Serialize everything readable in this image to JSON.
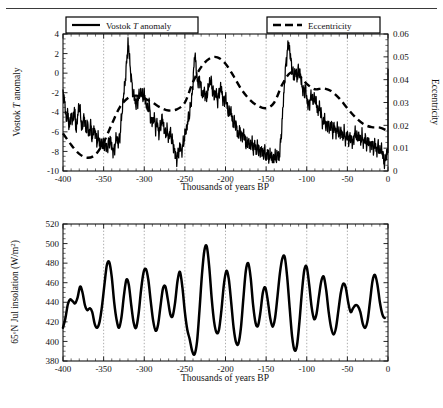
{
  "figure": {
    "divider": "horizontal-rule"
  },
  "chart_data": [
    {
      "type": "line",
      "id": "vostok-eccentricity",
      "title": "",
      "xlabel": "Thousands of years BP",
      "ylabel": "Vostok T anomaly",
      "ylabel2": "Eccentricity",
      "xlim": [
        -400,
        0
      ],
      "ylim": [
        -10,
        4
      ],
      "ylim2": [
        0,
        0.06
      ],
      "xticks": [
        -400,
        -350,
        -300,
        -250,
        -200,
        -150,
        -100,
        -50,
        0
      ],
      "xticklabels": [
        "-400",
        "-350",
        "-300",
        "-250",
        "-200",
        "-150",
        "-100",
        "-50",
        "0"
      ],
      "yticks": [
        -10,
        -8,
        -6,
        -4,
        -2,
        0,
        2,
        4
      ],
      "yticklabels": [
        "-10",
        "-8",
        "-6",
        "-4",
        "-2",
        "0",
        "2",
        "4"
      ],
      "y2ticks": [
        0,
        0.01,
        0.02,
        0.03,
        0.04,
        0.05,
        0.06
      ],
      "y2ticklabels": [
        "0",
        "0.01",
        "0.02",
        "0.03",
        "0.04",
        "0.05",
        "0.06"
      ],
      "grid": "vertical-dotted",
      "legend_position": "top",
      "legend": [
        {
          "label": "Vostok T anomaly",
          "style": "solid"
        },
        {
          "label": "Eccentricity",
          "style": "dashed"
        }
      ],
      "series": [
        {
          "name": "Vostok T anomaly",
          "style": "solid",
          "axis": "left",
          "x": [
            -400,
            -398,
            -396,
            -394,
            -392,
            -390,
            -388,
            -386,
            -384,
            -382,
            -380,
            -378,
            -376,
            -374,
            -372,
            -370,
            -368,
            -366,
            -364,
            -362,
            -360,
            -358,
            -356,
            -354,
            -352,
            -350,
            -348,
            -346,
            -344,
            -342,
            -340,
            -338,
            -336,
            -334,
            -332,
            -330,
            -328,
            -326,
            -324,
            -322,
            -320,
            -318,
            -316,
            -314,
            -312,
            -310,
            -308,
            -306,
            -304,
            -302,
            -300,
            -298,
            -296,
            -294,
            -292,
            -290,
            -288,
            -286,
            -284,
            -282,
            -280,
            -278,
            -276,
            -274,
            -272,
            -270,
            -268,
            -266,
            -264,
            -262,
            -260,
            -258,
            -256,
            -254,
            -252,
            -250,
            -248,
            -246,
            -244,
            -242,
            -240,
            -238,
            -236,
            -234,
            -232,
            -230,
            -228,
            -226,
            -224,
            -222,
            -220,
            -218,
            -216,
            -214,
            -212,
            -210,
            -208,
            -206,
            -204,
            -202,
            -200,
            -198,
            -196,
            -194,
            -192,
            -190,
            -188,
            -186,
            -184,
            -182,
            -180,
            -178,
            -176,
            -174,
            -172,
            -170,
            -168,
            -166,
            -164,
            -162,
            -160,
            -158,
            -156,
            -154,
            -152,
            -150,
            -148,
            -146,
            -144,
            -142,
            -140,
            -138,
            -136,
            -134,
            -132,
            -130,
            -128,
            -126,
            -124,
            -122,
            -120,
            -118,
            -116,
            -114,
            -112,
            -110,
            -108,
            -106,
            -104,
            -102,
            -100,
            -98,
            -96,
            -94,
            -92,
            -90,
            -88,
            -86,
            -84,
            -82,
            -80,
            -78,
            -76,
            -74,
            -72,
            -70,
            -68,
            -66,
            -64,
            -62,
            -60,
            -58,
            -56,
            -54,
            -52,
            -50,
            -48,
            -46,
            -44,
            -42,
            -40,
            -38,
            -36,
            -34,
            -32,
            -30,
            -28,
            -26,
            -24,
            -22,
            -20,
            -18,
            -16,
            -14,
            -12,
            -10,
            -8,
            -6,
            -4,
            -2,
            0
          ],
          "y": [
            -1.7,
            -3.0,
            -4.6,
            -4.2,
            -5.5,
            -4.0,
            -5.2,
            -3.6,
            -5.8,
            -4.5,
            -3.1,
            -4.8,
            -5.6,
            -4.2,
            -6.0,
            -5.0,
            -6.4,
            -5.2,
            -6.8,
            -5.6,
            -6.2,
            -7.0,
            -6.6,
            -7.4,
            -7.0,
            -7.6,
            -7.2,
            -7.8,
            -7.2,
            -6.8,
            -7.5,
            -8.1,
            -7.4,
            -6.5,
            -7.2,
            -6.4,
            -4.6,
            -2.8,
            -1.2,
            0.6,
            3.2,
            1.4,
            -0.6,
            -1.8,
            -2.6,
            -3.2,
            -2.8,
            -2.2,
            -2.0,
            -2.4,
            -2.1,
            -3.0,
            -3.8,
            -3.2,
            -4.6,
            -5.2,
            -4.4,
            -5.6,
            -5.0,
            -6.2,
            -5.4,
            -4.6,
            -5.4,
            -6.4,
            -5.8,
            -6.6,
            -6.0,
            -6.8,
            -7.4,
            -8.2,
            -8.8,
            -8.2,
            -7.4,
            -8.0,
            -7.2,
            -6.4,
            -5.6,
            -4.8,
            -4.0,
            -2.8,
            -1.2,
            2.2,
            0.4,
            -1.2,
            -0.4,
            -1.6,
            -2.4,
            -1.8,
            -2.6,
            -2.0,
            -1.0,
            -0.8,
            -1.6,
            -2.4,
            -1.9,
            -2.8,
            -2.1,
            -1.4,
            -2.2,
            -3.0,
            -2.4,
            -3.4,
            -4.2,
            -3.6,
            -4.6,
            -5.4,
            -4.8,
            -5.8,
            -6.4,
            -5.8,
            -6.6,
            -6.0,
            -6.8,
            -7.4,
            -6.8,
            -7.6,
            -7.0,
            -7.8,
            -7.2,
            -8.0,
            -7.4,
            -8.2,
            -7.6,
            -8.4,
            -7.8,
            -8.6,
            -8.0,
            -8.8,
            -8.2,
            -9.0,
            -8.4,
            -8.8,
            -8.2,
            -8.6,
            -7.0,
            -4.6,
            -1.8,
            0.6,
            2.2,
            3.0,
            1.6,
            0.4,
            -0.6,
            0.2,
            -0.4,
            0.4,
            -0.2,
            -1.2,
            -2.0,
            -1.4,
            -2.6,
            -3.4,
            -2.8,
            -2.2,
            -3.0,
            -2.4,
            -3.2,
            -4.0,
            -3.4,
            -4.4,
            -5.2,
            -4.6,
            -5.6,
            -5.0,
            -5.8,
            -5.2,
            -6.0,
            -5.4,
            -6.2,
            -5.6,
            -6.4,
            -5.8,
            -6.6,
            -6.0,
            -6.8,
            -6.2,
            -7.0,
            -6.4,
            -7.2,
            -6.6,
            -6.0,
            -6.8,
            -6.2,
            -7.0,
            -6.4,
            -7.2,
            -6.6,
            -7.4,
            -6.8,
            -7.6,
            -7.0,
            -7.8,
            -7.2,
            -8.0,
            -7.4,
            -8.2,
            -7.6,
            -8.6,
            -9.2,
            -8.4,
            -7.6,
            -8.2,
            -7.4,
            -6.2,
            -3.4,
            -0.6,
            1.4,
            2.2,
            0.6,
            1.2,
            0.2,
            -0.6,
            0.4
          ]
        },
        {
          "name": "Eccentricity",
          "style": "dashed",
          "axis": "right",
          "x": [
            -400,
            -390,
            -380,
            -370,
            -360,
            -350,
            -340,
            -330,
            -320,
            -310,
            -300,
            -290,
            -280,
            -270,
            -260,
            -250,
            -240,
            -230,
            -220,
            -210,
            -200,
            -190,
            -180,
            -170,
            -160,
            -150,
            -140,
            -130,
            -120,
            -110,
            -100,
            -90,
            -80,
            -70,
            -60,
            -50,
            -40,
            -30,
            -20,
            -10,
            0
          ],
          "y": [
            0.0165,
            0.0115,
            0.0075,
            0.0058,
            0.0072,
            0.0125,
            0.0205,
            0.028,
            0.032,
            0.033,
            0.0318,
            0.03,
            0.0278,
            0.0265,
            0.027,
            0.03,
            0.039,
            0.0455,
            0.0492,
            0.0498,
            0.047,
            0.0415,
            0.0355,
            0.0312,
            0.0285,
            0.0275,
            0.03,
            0.038,
            0.043,
            0.042,
            0.0382,
            0.0358,
            0.0362,
            0.035,
            0.0318,
            0.0275,
            0.0235,
            0.0205,
            0.0192,
            0.019,
            0.0175
          ]
        }
      ]
    },
    {
      "type": "line",
      "id": "insolation",
      "title": "",
      "xlabel": "Thousands of years BP",
      "ylabel": "65°N Jul insolation (W/m2)",
      "xlim": [
        -400,
        0
      ],
      "ylim": [
        380,
        520
      ],
      "xticks": [
        -400,
        -350,
        -300,
        -250,
        -200,
        -150,
        -100,
        -50,
        0
      ],
      "xticklabels": [
        "-400",
        "-350",
        "-300",
        "-250",
        "-200",
        "-150",
        "-100",
        "-50",
        "0"
      ],
      "yticks": [
        380,
        400,
        420,
        440,
        460,
        480,
        500,
        520
      ],
      "yticklabels": [
        "380",
        "400",
        "420",
        "440",
        "460",
        "480",
        "500",
        "520"
      ],
      "grid": "vertical-dotted",
      "series": [
        {
          "name": "65N July insolation",
          "style": "thick-solid",
          "x": [
            -400,
            -397,
            -394,
            -391,
            -388,
            -385,
            -382,
            -379,
            -376,
            -373,
            -370,
            -367,
            -364,
            -361,
            -358,
            -355,
            -352,
            -349,
            -346,
            -343,
            -340,
            -337,
            -334,
            -331,
            -328,
            -325,
            -322,
            -319,
            -316,
            -313,
            -310,
            -307,
            -304,
            -301,
            -298,
            -295,
            -292,
            -289,
            -286,
            -283,
            -280,
            -277,
            -274,
            -271,
            -268,
            -265,
            -262,
            -259,
            -256,
            -253,
            -250,
            -247,
            -244,
            -241,
            -238,
            -235,
            -232,
            -229,
            -226,
            -223,
            -220,
            -217,
            -214,
            -211,
            -208,
            -205,
            -202,
            -199,
            -196,
            -193,
            -190,
            -187,
            -184,
            -181,
            -178,
            -175,
            -172,
            -169,
            -166,
            -163,
            -160,
            -157,
            -154,
            -151,
            -148,
            -145,
            -142,
            -139,
            -136,
            -133,
            -130,
            -127,
            -124,
            -121,
            -118,
            -115,
            -112,
            -109,
            -106,
            -103,
            -100,
            -97,
            -94,
            -91,
            -88,
            -85,
            -82,
            -79,
            -76,
            -73,
            -70,
            -67,
            -64,
            -61,
            -58,
            -55,
            -52,
            -49,
            -46,
            -43,
            -40,
            -37,
            -34,
            -31,
            -28,
            -25,
            -22,
            -19,
            -16,
            -13,
            -10,
            -7,
            -4,
            -1,
            0
          ],
          "y": [
            414,
            424,
            438,
            443,
            441,
            439,
            445,
            456,
            450,
            437,
            432,
            434,
            430,
            418,
            414,
            420,
            436,
            458,
            478,
            481,
            466,
            440,
            422,
            414,
            425,
            447,
            463,
            458,
            437,
            419,
            414,
            428,
            452,
            470,
            474,
            463,
            441,
            421,
            411,
            417,
            436,
            454,
            456,
            443,
            428,
            426,
            440,
            462,
            471,
            455,
            430,
            412,
            402,
            390,
            387,
            400,
            432,
            468,
            493,
            497,
            476,
            444,
            420,
            409,
            412,
            432,
            458,
            472,
            464,
            440,
            414,
            399,
            398,
            414,
            444,
            472,
            480,
            465,
            437,
            419,
            416,
            430,
            450,
            455,
            442,
            424,
            415,
            424,
            446,
            470,
            485,
            486,
            465,
            434,
            405,
            391,
            396,
            420,
            450,
            473,
            476,
            458,
            435,
            423,
            428,
            446,
            462,
            466,
            452,
            430,
            414,
            407,
            414,
            432,
            450,
            459,
            455,
            440,
            430,
            434,
            437,
            436,
            430,
            418,
            414,
            422,
            442,
            462,
            468,
            458,
            440,
            428,
            424,
            427
          ]
        }
      ]
    }
  ]
}
